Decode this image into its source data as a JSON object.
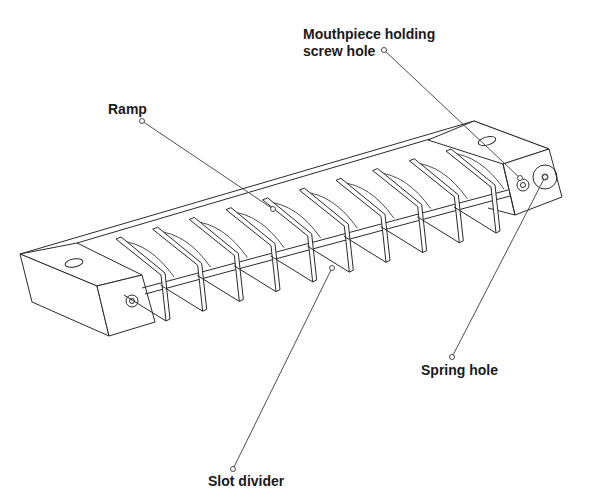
{
  "figure": {
    "colors": {
      "background": "#ffffff",
      "line": "#2a2a2a",
      "label": "#1a1a1a"
    },
    "slot_divider_count": 10
  },
  "labels": [
    {
      "id": "mouthpiece",
      "text": "Mouthpiece holding\nscrew hole",
      "x": 303,
      "y": 26,
      "pin": [
        384,
        50
      ],
      "target": [
        520,
        178
      ]
    },
    {
      "id": "ramp",
      "text": "Ramp",
      "x": 108,
      "y": 101,
      "pin": [
        142,
        121
      ],
      "target": [
        273,
        209
      ]
    },
    {
      "id": "spring",
      "text": "Spring hole",
      "x": 421,
      "y": 362,
      "pin": [
        452,
        357
      ],
      "target": [
        545,
        177
      ]
    },
    {
      "id": "slot",
      "text": "Slot divider",
      "x": 208,
      "y": 473,
      "pin": [
        233,
        469
      ],
      "target": [
        332,
        268
      ]
    }
  ]
}
